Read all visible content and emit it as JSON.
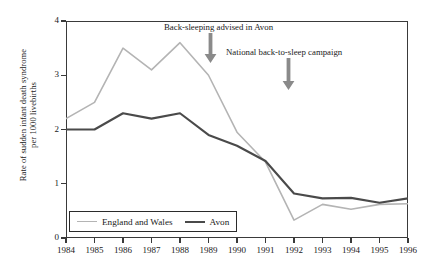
{
  "chart_data": {
    "type": "line",
    "title": "",
    "xlabel": "",
    "ylabel": "Rate of sudden infant death syndrome per 1000 livebirths",
    "ylabel_line1": "Rate of sudden infant death syndrome",
    "ylabel_line2": "per 1000 livebirths",
    "x": [
      1984,
      1985,
      1986,
      1987,
      1988,
      1989,
      1990,
      1991,
      1992,
      1993,
      1994,
      1995,
      1996
    ],
    "categories": [
      "1984",
      "1985",
      "1986",
      "1987",
      "1988",
      "1989",
      "1990",
      "1991",
      "1992",
      "1993",
      "1994",
      "1995",
      "1996"
    ],
    "xlim": [
      1984,
      1996
    ],
    "ylim": [
      0,
      4
    ],
    "yticks": [
      0,
      1,
      2,
      3,
      4
    ],
    "ytick_labels": [
      "0",
      "1",
      "2",
      "3",
      "4"
    ],
    "grid": false,
    "legend_position": "bottom-left",
    "series": [
      {
        "name": "England and Wales",
        "color": "#b4b4b4",
        "values": [
          2.2,
          2.5,
          3.5,
          3.1,
          3.6,
          3.0,
          1.95,
          1.4,
          0.33,
          0.62,
          0.53,
          0.62,
          0.63
        ]
      },
      {
        "name": "Avon",
        "color": "#4a4a4a",
        "values": [
          2.0,
          2.0,
          2.3,
          2.2,
          2.3,
          1.9,
          1.7,
          1.42,
          0.82,
          0.73,
          0.74,
          0.65,
          0.73
        ]
      }
    ],
    "annotations": [
      {
        "id": "back-sleeping-advised-avon",
        "text": "Back-sleeping advised in Avon",
        "arrow_x": 1988.75,
        "arrow_color": "#8a8a8a",
        "label_left_px": 164,
        "label_top_px": 22,
        "arrow_left_px": 204,
        "arrow_top_px": 33,
        "arrow_height_px": 30
      },
      {
        "id": "national-back-to-sleep-campaign",
        "text": "National back-to-sleep campaign",
        "arrow_x": 1990.85,
        "arrow_color": "#8a8a8a",
        "label_left_px": 226,
        "label_top_px": 47,
        "arrow_left_px": 282,
        "arrow_top_px": 58,
        "arrow_height_px": 32
      }
    ]
  },
  "legend": {
    "items": [
      {
        "label": "England and Wales",
        "color": "#b4b4b4"
      },
      {
        "label": "Avon",
        "color": "#4a4a4a"
      }
    ]
  },
  "colors": {
    "axis": "#3a3a3a",
    "background": "#ffffff",
    "text": "#1a1a1a",
    "series_england_wales": "#b4b4b4",
    "series_avon": "#4a4a4a",
    "arrow": "#8a8a8a"
  }
}
